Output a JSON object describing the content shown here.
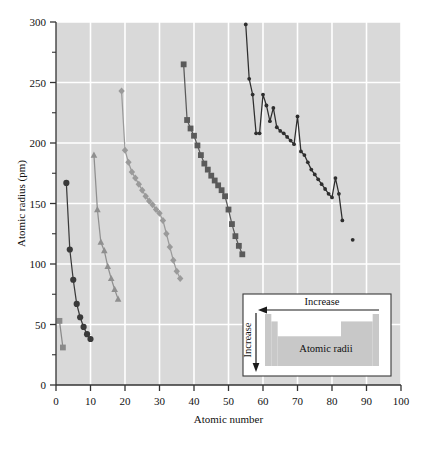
{
  "chart_data": {
    "type": "line",
    "title": "",
    "xlabel": "Atomic number",
    "ylabel": "Atomic radius (pm)",
    "xlim": [
      0,
      100
    ],
    "ylim": [
      0,
      300
    ],
    "xticks": [
      0,
      10,
      20,
      30,
      40,
      50,
      60,
      70,
      80,
      90,
      100
    ],
    "yticks": [
      0,
      50,
      100,
      150,
      200,
      250,
      300
    ],
    "yminorticks": [
      25,
      75,
      125,
      175,
      225,
      275
    ],
    "grid": true,
    "legend_position": "none",
    "background": "#d9d9d9",
    "gridline_color": "#ffffff",
    "series": [
      {
        "name": "Period 1",
        "marker": "square",
        "color": "#8a8a8a",
        "x": [
          1,
          2
        ],
        "values": [
          53,
          31
        ]
      },
      {
        "name": "Period 2",
        "marker": "circle",
        "color": "#3a3a3a",
        "x": [
          3,
          4,
          5,
          6,
          7,
          8,
          9,
          10
        ],
        "values": [
          167,
          112,
          87,
          67,
          56,
          48,
          42,
          38
        ]
      },
      {
        "name": "Period 3",
        "marker": "triangle",
        "color": "#8f8f8f",
        "x": [
          11,
          12,
          13,
          14,
          15,
          16,
          17,
          18
        ],
        "values": [
          190,
          145,
          118,
          111,
          98,
          88,
          79,
          71
        ]
      },
      {
        "name": "Period 4",
        "marker": "diamond",
        "color": "#9a9a9a",
        "x": [
          19,
          20,
          21,
          22,
          23,
          24,
          25,
          26,
          27,
          28,
          29,
          30,
          31,
          32,
          33,
          34,
          35,
          36
        ],
        "values": [
          243,
          194,
          184,
          176,
          171,
          166,
          161,
          156,
          152,
          149,
          145,
          142,
          136,
          125,
          114,
          103,
          94,
          88
        ]
      },
      {
        "name": "Period 5",
        "marker": "square",
        "color": "#5a5a5a",
        "x": [
          37,
          38,
          39,
          40,
          41,
          42,
          43,
          44,
          45,
          46,
          47,
          48,
          49,
          50,
          51,
          52,
          53,
          54
        ],
        "values": [
          265,
          219,
          212,
          206,
          198,
          190,
          183,
          178,
          173,
          169,
          165,
          161,
          156,
          145,
          133,
          123,
          115,
          108
        ]
      },
      {
        "name": "Period 6",
        "marker": "dot",
        "color": "#2e2e2e",
        "x": [
          55,
          56,
          57,
          58,
          59,
          60,
          61,
          62,
          63,
          64,
          65,
          66,
          67,
          68,
          69,
          70,
          71,
          72,
          73,
          74,
          75,
          76,
          77,
          78,
          79,
          80,
          81,
          82,
          83
        ],
        "values": [
          298,
          253,
          240,
          208,
          208,
          240,
          231,
          218,
          229,
          213,
          210,
          208,
          205,
          202,
          199,
          222,
          193,
          190,
          184,
          178,
          174,
          170,
          166,
          162,
          158,
          155,
          171,
          158,
          136
        ]
      },
      {
        "name": "Period 6 outlier",
        "marker": "dot",
        "color": "#2e2e2e",
        "x": [
          86
        ],
        "values": [
          120
        ]
      }
    ]
  },
  "inset": {
    "horizontal_label": "Increase",
    "vertical_label": "Increase",
    "body_label": "Atomic radii",
    "border_color": "#3a3a3a",
    "fill_color": "#c8c8c8",
    "background": "#ffffff"
  }
}
